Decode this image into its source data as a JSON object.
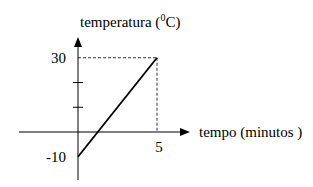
{
  "chart_data": {
    "type": "line",
    "title": "",
    "xlabel": "tempo (minutos )",
    "ylabel": "temperatura (⁰C)",
    "ylabel_parts": {
      "pre": "temperatura (",
      "sup": "0",
      "post": "C)"
    },
    "x_tick_labels": [
      {
        "value": 5,
        "label": "5"
      }
    ],
    "y_tick_labels": [
      {
        "value": 30,
        "label": "30"
      },
      {
        "value": -10,
        "label": "-10"
      }
    ],
    "y_unlabeled_ticks": [
      10,
      20
    ],
    "xlim": [
      -3.3,
      6.3
    ],
    "ylim": [
      -18,
      37
    ],
    "grid": false,
    "legend": "none",
    "series": [
      {
        "name": "temperatura",
        "x": [
          0,
          5
        ],
        "y": [
          -10,
          30
        ],
        "color": "#000000"
      }
    ],
    "guides": [
      {
        "type": "dashed",
        "x": 5,
        "y": 30
      }
    ]
  }
}
